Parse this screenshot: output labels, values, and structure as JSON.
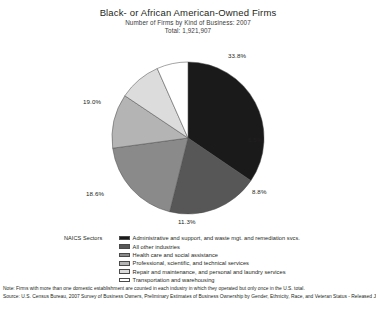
{
  "header": {
    "title": "Black- or African American-Owned Firms",
    "subtitle_1": "Number of Firms by Kind of Business: 2007",
    "subtitle_2": "Total: 1,921,907"
  },
  "legend": {
    "title": "NAICS Sectors",
    "items": [
      {
        "label": "Administrative and support, and waste mgt. and remediation svcs.",
        "color": "#1a1a1a"
      },
      {
        "label": "All other industries",
        "color": "#575757"
      },
      {
        "label": "Health care and social assistance",
        "color": "#8a8a8a"
      },
      {
        "label": "Professional, scientific, and technical services",
        "color": "#b4b4b4"
      },
      {
        "label": "Repair and maintenance, and personal and laundry services",
        "color": "#dcdcdc"
      },
      {
        "label": "Transportation and warehousing",
        "color": "#ffffff"
      }
    ]
  },
  "footnotes": {
    "note": "Note: Firms with more than one domestic establishment are counted in each industry in which they operated but only once in the U.S. total.",
    "source": "Source: U.S. Census Bureau, 2007 Survey of Business Owners, Preliminary Estimates of Business Ownership by Gender, Ethnicity, Race, and Veteran Status - Released July 13, 2010"
  },
  "chart_data": {
    "type": "pie",
    "title": "Black- or African American-Owned Firms",
    "subtitle": "Number of Firms by Kind of Business: 2007",
    "total_label": "Total: 1,921,907",
    "total_value": 1921907,
    "legend_title": "NAICS Sectors",
    "legend_position": "bottom",
    "value_unit": "percent",
    "labels": [
      "Administrative and support, and waste mgt. and remediation svcs.",
      "All other industries",
      "Health care and social assistance",
      "Professional, scientific, and technical services",
      "Repair and maintenance, and personal and laundry services",
      "Transportation and warehousing"
    ],
    "values": [
      33.8,
      19.0,
      18.6,
      11.3,
      8.8,
      6.5
    ],
    "value_labels": [
      "33.8%",
      "19.0%",
      "18.6%",
      "11.3%",
      "8.8%",
      "6.5%"
    ],
    "colors": [
      "#1a1a1a",
      "#575757",
      "#8a8a8a",
      "#b4b4b4",
      "#dcdcdc",
      "#ffffff"
    ],
    "start_angle_deg": 0,
    "direction": "clockwise",
    "grid": false
  }
}
